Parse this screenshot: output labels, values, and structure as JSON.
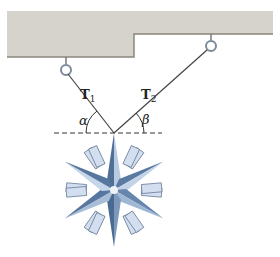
{
  "diagram": {
    "colors": {
      "ceiling_fill": "#d6d3cc",
      "ceiling_edge": "#8a867e",
      "cable": "#444444",
      "snowflake_dark": "#5d7fa8",
      "snowflake_light": "#c9d8ea",
      "branch_fill": "#d3dff0",
      "dashed": "#333333"
    },
    "labels": {
      "T1_main": "T",
      "T1_sub": "1",
      "T2_main": "T",
      "T2_sub": "2",
      "alpha": "α",
      "beta": "β"
    },
    "points": {
      "left_hook": [
        66,
        68
      ],
      "right_hook": [
        211,
        45
      ],
      "junction": [
        114,
        133
      ],
      "snowflake_center": [
        114,
        190
      ]
    }
  }
}
